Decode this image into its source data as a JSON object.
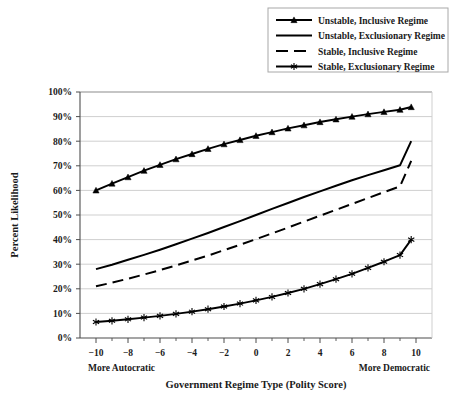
{
  "chart_data": {
    "type": "line",
    "title": "",
    "xlabel": "Government Regime Type (Polity Score)",
    "ylabel": "Percent Likelihood",
    "xlim": [
      -11,
      11
    ],
    "ylim": [
      0,
      100
    ],
    "grid": true,
    "legend_position": "top-right",
    "x": [
      -10,
      -9,
      -8,
      -7,
      -6,
      -5,
      -4,
      -3,
      -2,
      -1,
      0,
      1,
      2,
      3,
      4,
      5,
      6,
      7,
      8,
      9,
      9.7
    ],
    "x_tick_labels": [
      "−10",
      "−8",
      "−6",
      "−4",
      "−2",
      "0",
      "2",
      "4",
      "6",
      "8",
      "10"
    ],
    "x_tick_values": [
      -10,
      -8,
      -6,
      -4,
      -2,
      0,
      2,
      4,
      6,
      8,
      10
    ],
    "x_minor_tick_values": [
      -9,
      -7,
      -5,
      -3,
      -1,
      1,
      3,
      5,
      7,
      9
    ],
    "y_tick_labels": [
      "0%",
      "10%",
      "20%",
      "30%",
      "40%",
      "50%",
      "60%",
      "70%",
      "80%",
      "90%",
      "100%"
    ],
    "y_tick_values": [
      0,
      10,
      20,
      30,
      40,
      50,
      60,
      70,
      80,
      90,
      100
    ],
    "x_axis_left_annotation": "More Autocratic",
    "x_axis_right_annotation": "More Democratic",
    "series": [
      {
        "name": "Unstable, Inclusive Regime",
        "style": "solid",
        "marker": "triangle",
        "color": "#000000",
        "values": [
          60.0,
          62.8,
          65.4,
          68.0,
          70.4,
          72.7,
          74.8,
          76.9,
          78.8,
          80.5,
          82.2,
          83.7,
          85.2,
          86.5,
          87.8,
          88.9,
          90.0,
          91.0,
          91.9,
          92.8,
          93.9
        ]
      },
      {
        "name": "Unstable, Exclusionary Regime",
        "style": "solid",
        "marker": "none",
        "color": "#000000",
        "values": [
          28.0,
          29.8,
          31.8,
          33.8,
          35.9,
          38.1,
          40.4,
          42.7,
          45.1,
          47.5,
          50.0,
          52.5,
          54.9,
          57.3,
          59.6,
          61.9,
          64.1,
          66.2,
          68.2,
          70.2,
          80.0
        ]
      },
      {
        "name": "Stable, Inclusive Regime",
        "style": "dashed",
        "marker": "none",
        "color": "#000000",
        "values": [
          21.0,
          22.5,
          24.1,
          25.8,
          27.6,
          29.5,
          31.5,
          33.5,
          35.7,
          37.9,
          40.2,
          42.5,
          44.9,
          47.3,
          49.7,
          52.1,
          54.5,
          56.9,
          59.3,
          61.6,
          72.0
        ]
      },
      {
        "name": "Stable, Exclusionary Regime",
        "style": "solid",
        "marker": "star",
        "color": "#000000",
        "values": [
          6.5,
          7.0,
          7.6,
          8.3,
          9.0,
          9.8,
          10.7,
          11.7,
          12.8,
          14.0,
          15.3,
          16.7,
          18.3,
          20.0,
          21.9,
          23.9,
          26.1,
          28.5,
          31.0,
          33.7,
          40.0
        ]
      }
    ]
  },
  "legend": {
    "items": [
      {
        "label": "Unstable, Inclusive Regime"
      },
      {
        "label": "Unstable, Exclusionary Regime"
      },
      {
        "label": "Stable, Inclusive Regime"
      },
      {
        "label": "Stable, Exclusionary Regime"
      }
    ]
  },
  "colors": {
    "line": "#000000",
    "grid": "#cfcfcf",
    "axis": "#4d4d4d",
    "legend_border": "#a8a8a8",
    "background": "#ffffff"
  }
}
